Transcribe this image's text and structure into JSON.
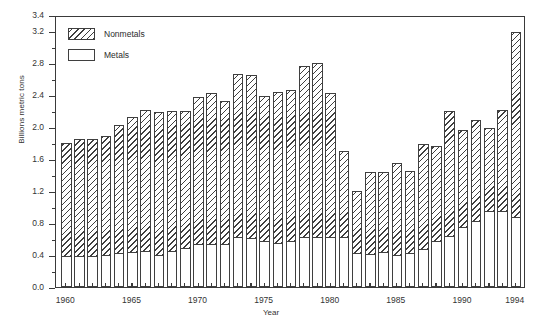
{
  "chart_data": {
    "type": "bar",
    "subtype": "stacked-vertical",
    "title": "",
    "xlabel": "Year",
    "ylabel": "Billions metric tons",
    "ylim": [
      0.0,
      3.4
    ],
    "ytick_step": 0.4,
    "yminor_step": 0.2,
    "grid": false,
    "legend_position": "top-left",
    "ytick_labels": [
      "0.0",
      "0.4",
      "0.8",
      "1.2",
      "1.6",
      "2.0",
      "2.4",
      "2.8",
      "3.2",
      "3.4"
    ],
    "ytick_values": [
      0.0,
      0.4,
      0.8,
      1.2,
      1.6,
      2.0,
      2.4,
      2.8,
      3.2,
      3.4
    ],
    "yminor_values": [
      0.2,
      0.6,
      1.0,
      1.4,
      1.8,
      2.2,
      2.6,
      3.0
    ],
    "xtick_labels": [
      "1960",
      "1965",
      "1970",
      "1975",
      "1980",
      "1985",
      "1990",
      "1994"
    ],
    "xtick_years": [
      1960,
      1965,
      1970,
      1975,
      1980,
      1985,
      1990,
      1994
    ],
    "categories": [
      1960,
      1961,
      1962,
      1963,
      1964,
      1965,
      1966,
      1967,
      1968,
      1969,
      1970,
      1971,
      1972,
      1973,
      1974,
      1975,
      1976,
      1977,
      1978,
      1979,
      1980,
      1981,
      1982,
      1983,
      1984,
      1985,
      1986,
      1987,
      1988,
      1989,
      1990,
      1991,
      1992,
      1993,
      1994
    ],
    "series": [
      {
        "name": "Metals",
        "fill": "white",
        "values": [
          0.39,
          0.39,
          0.39,
          0.4,
          0.42,
          0.44,
          0.45,
          0.4,
          0.45,
          0.49,
          0.54,
          0.54,
          0.54,
          0.62,
          0.61,
          0.57,
          0.55,
          0.58,
          0.62,
          0.62,
          0.62,
          0.63,
          0.43,
          0.41,
          0.44,
          0.4,
          0.42,
          0.48,
          0.58,
          0.64,
          0.75,
          0.83,
          0.95,
          0.95,
          0.87
        ]
      },
      {
        "name": "Nonmetals",
        "fill": "hatched",
        "values": [
          1.42,
          1.48,
          1.47,
          1.5,
          1.62,
          1.7,
          1.78,
          1.8,
          1.76,
          1.72,
          1.85,
          1.9,
          1.8,
          2.06,
          2.05,
          1.83,
          1.9,
          1.9,
          2.16,
          2.19,
          1.82,
          1.08,
          0.79,
          1.04,
          1.01,
          1.17,
          1.05,
          1.32,
          1.2,
          1.57,
          1.23,
          1.27,
          1.05,
          1.28,
          2.33
        ]
      }
    ],
    "totals": [
      1.81,
      1.87,
      1.86,
      1.9,
      2.04,
      2.14,
      2.23,
      2.2,
      2.21,
      2.21,
      2.39,
      2.44,
      2.34,
      2.68,
      2.66,
      2.4,
      2.45,
      2.48,
      2.78,
      2.81,
      2.44,
      1.71,
      1.22,
      1.45,
      1.45,
      1.57,
      1.47,
      1.8,
      1.78,
      2.21,
      1.98,
      2.1,
      2.0,
      2.23,
      3.2
    ],
    "legend": [
      {
        "label": "Nonmetals",
        "swatch": "hatched"
      },
      {
        "label": "Metals",
        "swatch": "white"
      }
    ],
    "colors": {
      "outline": "#3f3f3f",
      "frame": "#3a3a3a",
      "metals_fill": "#ffffff",
      "nonmetals_hatch": "#3f3f3f",
      "background": "#ffffff",
      "text": "#333333"
    }
  }
}
